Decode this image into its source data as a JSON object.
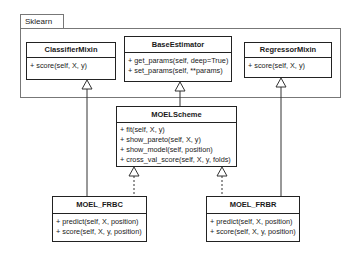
{
  "package": {
    "name": "Sklearn"
  },
  "classes": {
    "classifier_mixin": {
      "name": "ClassifierMixin",
      "methods": [
        "+ score(self, X, y)"
      ]
    },
    "base_estimator": {
      "name": "BaseEstimator",
      "methods": [
        "+ get_params(self, deep=True)",
        "+ set_params(self, **params)"
      ]
    },
    "regressor_mixin": {
      "name": "RegressorMixin",
      "methods": [
        "+ score(self, X, y)"
      ]
    },
    "moel_scheme": {
      "name": "MOELScheme",
      "methods": [
        "+ fit(self, X, y)",
        "+ show_pareto(self, X, y)",
        "+ show_model(self, position)",
        "+ cross_val_score(self, X, y, folds)"
      ]
    },
    "moel_frbc": {
      "name": "MOEL_FRBC",
      "methods": [
        "+ predict(self, X, position)",
        "+ score(self, X, y, position)"
      ]
    },
    "moel_frbr": {
      "name": "MOEL_FRBR",
      "methods": [
        "+ predict(self, X, position)",
        "+ score(self, X, y, position)"
      ]
    }
  },
  "relations": [
    {
      "from": "MOELScheme",
      "to": "BaseEstimator",
      "type": "generalization",
      "style": "solid"
    },
    {
      "from": "MOEL_FRBC",
      "to": "ClassifierMixin",
      "type": "generalization",
      "style": "solid"
    },
    {
      "from": "MOEL_FRBR",
      "to": "RegressorMixin",
      "type": "generalization",
      "style": "solid"
    },
    {
      "from": "MOEL_FRBC",
      "to": "MOELScheme",
      "type": "realization",
      "style": "dashed"
    },
    {
      "from": "MOEL_FRBR",
      "to": "MOELScheme",
      "type": "realization",
      "style": "dashed"
    }
  ]
}
